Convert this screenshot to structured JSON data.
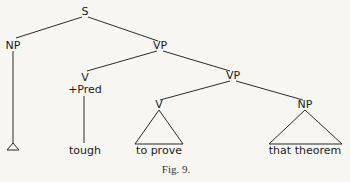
{
  "diagram": {
    "type": "syntax-tree",
    "caption": "Fig. 9.",
    "nodes": {
      "s": "S",
      "np_subject": "NP",
      "vp_main": "VP",
      "v_pred": "V",
      "v_pred_feature": "+Pred",
      "v_pred_word": "tough",
      "vp_inner": "VP",
      "v_inner": "V",
      "v_inner_words": "to prove",
      "np_object": "NP",
      "np_object_words": "that theorem"
    },
    "edges": [
      [
        "S",
        "NP"
      ],
      [
        "S",
        "VP"
      ],
      [
        "VP",
        "V"
      ],
      [
        "VP",
        "VP"
      ],
      [
        "V",
        "tough"
      ],
      [
        "VP",
        "V"
      ],
      [
        "VP",
        "NP"
      ],
      [
        "V",
        "to prove"
      ],
      [
        "NP",
        "that theorem"
      ],
      [
        "NP",
        "empty-triangle"
      ]
    ]
  }
}
